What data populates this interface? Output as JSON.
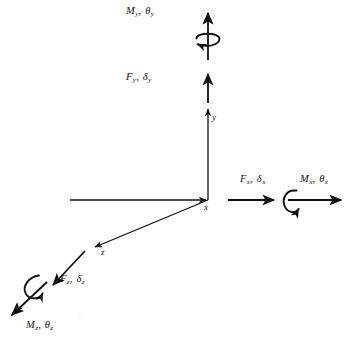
{
  "figure": {
    "type": "engineering-diagram",
    "background_color": "#ffffff",
    "line_color": "#111111",
    "origin": {
      "x": 208,
      "y": 200
    }
  },
  "axes": [
    {
      "id": "x",
      "label": "x",
      "label_pos": {
        "x": 204,
        "y": 205
      },
      "direction": "right-horizontal",
      "from": {
        "x": 70,
        "y": 200
      },
      "to": {
        "x": 208,
        "y": 200
      }
    },
    {
      "id": "y",
      "label": "y",
      "label_pos": {
        "x": 212,
        "y": 116
      },
      "direction": "up-vertical",
      "from": {
        "x": 208,
        "y": 200
      },
      "to": {
        "x": 208,
        "y": 106
      }
    },
    {
      "id": "z",
      "label": "z",
      "label_pos": {
        "x": 101,
        "y": 252
      },
      "direction": "lower-left-diagonal",
      "from": {
        "x": 208,
        "y": 200
      },
      "to": {
        "x": 92,
        "y": 248
      }
    }
  ],
  "loads": [
    {
      "id": "My",
      "symbol": "M",
      "subscript": "y",
      "greek": "θ",
      "greek_subscript": "y",
      "kind": "moment",
      "arrow": "double-head",
      "label_pos": {
        "x": 126,
        "y": 6
      },
      "curl": "around-y-axis-ccw"
    },
    {
      "id": "Fy",
      "symbol": "F",
      "subscript": "y",
      "greek": "δ",
      "greek_subscript": "y",
      "kind": "force",
      "arrow": "single-head",
      "label_pos": {
        "x": 126,
        "y": 72
      }
    },
    {
      "id": "Fx",
      "symbol": "F",
      "subscript": "x",
      "greek": "δ",
      "greek_subscript": "x",
      "kind": "force",
      "arrow": "single-head",
      "label_pos": {
        "x": 240,
        "y": 174
      }
    },
    {
      "id": "Mx",
      "symbol": "M",
      "subscript": "x",
      "greek": "θ",
      "greek_subscript": "x",
      "kind": "moment",
      "arrow": "double-head",
      "label_pos": {
        "x": 300,
        "y": 174
      },
      "curl": "around-x-axis-ccw"
    },
    {
      "id": "Fz",
      "symbol": "F",
      "subscript": "z",
      "greek": "δ",
      "greek_subscript": "z",
      "kind": "force",
      "arrow": "single-head",
      "label_pos": {
        "x": 60,
        "y": 274
      }
    },
    {
      "id": "Mz",
      "symbol": "M",
      "subscript": "z",
      "greek": "θ",
      "greek_subscript": "z",
      "kind": "moment",
      "arrow": "double-head",
      "label_pos": {
        "x": 26,
        "y": 320
      },
      "curl": "around-z-axis-ccw"
    }
  ],
  "separator": ", ",
  "watermark": "e"
}
